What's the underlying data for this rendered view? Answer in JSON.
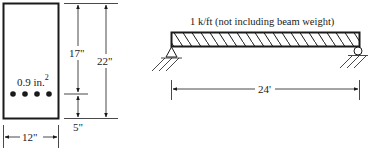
{
  "section": {
    "rebar_area": "0.9 in.",
    "rebar_area_exp": "2",
    "rebar_count": 4,
    "dim_effective_depth": "17\"",
    "dim_total_depth": "22\"",
    "dim_cover": "5\"",
    "dim_width": "12\""
  },
  "beam": {
    "load_label": "1 k/ft (not including beam weight)",
    "span_label": "24'",
    "left_support": "pin",
    "right_support": "roller"
  },
  "colors": {
    "ink": "#1a1a1a",
    "background": "#ffffff"
  }
}
